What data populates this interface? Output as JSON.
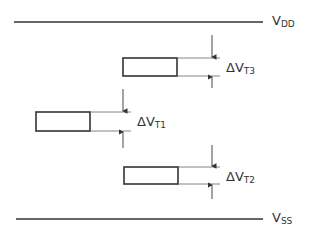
{
  "diagram": {
    "rails": {
      "vdd": {
        "label_main": "V",
        "label_sub": "DD"
      },
      "vss": {
        "label_main": "V",
        "label_sub": "SS"
      }
    },
    "offsets": [
      {
        "id": "t3",
        "label_main": "ΔV",
        "label_sub": "T3"
      },
      {
        "id": "t1",
        "label_main": "ΔV",
        "label_sub": "T1"
      },
      {
        "id": "t2",
        "label_main": "ΔV",
        "label_sub": "T2"
      }
    ],
    "colors": {
      "stroke": "#333333",
      "thin": "#666666",
      "background": "#ffffff"
    }
  }
}
